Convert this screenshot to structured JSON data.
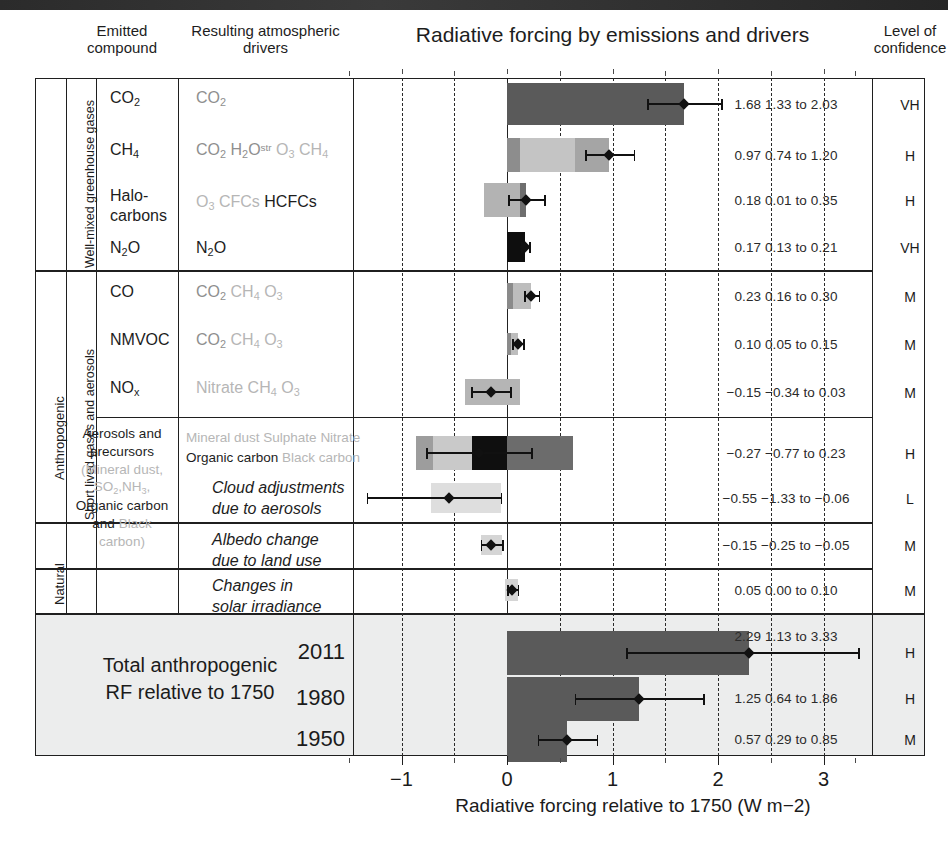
{
  "figure": {
    "title": "Radiative forcing by emissions and drivers",
    "header_emitted": "Emitted\ncompound",
    "header_emitted_l1": "Emitted",
    "header_emitted_l2": "compound",
    "header_drivers_l1": "Resulting atmospheric",
    "header_drivers_l2": "drivers",
    "header_confidence_l1": "Level of",
    "header_confidence_l2": "confidence",
    "axis_title": "Radiative forcing relative to 1750 (W m−2)",
    "total_label_l1": "Total anthropogenic",
    "total_label_l2": "RF relative to 1750"
  },
  "side_labels": {
    "anthropogenic": "Anthropogenic",
    "natural": "Natural",
    "wmgg": "Well-mixed greenhouse gases",
    "short_lived": "Short lived gases and aerosols"
  },
  "axis": {
    "ticks": [
      "−1",
      "0",
      "1",
      "2",
      "3"
    ],
    "tick_values": [
      -1,
      0,
      1,
      2,
      3
    ],
    "xmin": -1.5,
    "xmax": 3.4,
    "dashed_gridlines": [
      -1.0,
      -0.5,
      0.5,
      1.0,
      1.5,
      2.0,
      2.5,
      3.0
    ],
    "unit": "W m−2"
  },
  "rows": [
    {
      "id": "co2",
      "emitted": "CO2",
      "drivers": [
        {
          "t": "CO2",
          "shade": "dark"
        }
      ],
      "value_text": "1.68 1.33 to 2.03",
      "best": 1.68,
      "lo": 1.33,
      "hi": 2.03,
      "confidence": "VH",
      "segments": [
        {
          "from": 0,
          "to": 1.68,
          "fill": "#5a5a5a"
        }
      ]
    },
    {
      "id": "ch4",
      "emitted": "CH4",
      "drivers": [
        {
          "t": "CO2",
          "shade": "mid"
        },
        {
          "t": "H2Ostr",
          "shade": "mid"
        },
        {
          "t": "O3",
          "shade": "light"
        },
        {
          "t": "CH4",
          "shade": "light"
        }
      ],
      "value_text": "0.97 0.74 to 1.20",
      "best": 0.97,
      "lo": 0.74,
      "hi": 1.2,
      "confidence": "H",
      "segments": [
        {
          "from": 0,
          "to": 0.12,
          "fill": "#8d8d8d"
        },
        {
          "from": 0.12,
          "to": 0.64,
          "fill": "#c4c4c4"
        },
        {
          "from": 0.64,
          "to": 0.97,
          "fill": "#a5a5a5"
        }
      ]
    },
    {
      "id": "halocarbons",
      "emitted_l1": "Halo-",
      "emitted_l2": "carbons",
      "drivers": [
        {
          "t": "O3",
          "shade": "light"
        },
        {
          "t": "CFCs",
          "shade": "light"
        },
        {
          "t": "HCFCs",
          "shade": "dark"
        }
      ],
      "value_text": "0.18 0.01 to 0.35",
      "best": 0.18,
      "lo": 0.01,
      "hi": 0.35,
      "confidence": "H",
      "segments": [
        {
          "from": -0.22,
          "to": 0.12,
          "fill": "#b3b3b3"
        },
        {
          "from": 0.12,
          "to": 0.18,
          "fill": "#6e6e6e"
        }
      ]
    },
    {
      "id": "n2o",
      "emitted": "N2O",
      "drivers": [
        {
          "t": "N2O",
          "shade": "dark"
        }
      ],
      "value_text": "0.17 0.13 to 0.21",
      "best": 0.17,
      "lo": 0.13,
      "hi": 0.21,
      "confidence": "VH",
      "segments": [
        {
          "from": 0,
          "to": 0.17,
          "fill": "#0e0e0e"
        }
      ]
    },
    {
      "id": "co",
      "emitted": "CO",
      "drivers": [
        {
          "t": "CO2",
          "shade": "mid"
        },
        {
          "t": "CH4",
          "shade": "light"
        },
        {
          "t": "O3",
          "shade": "light"
        }
      ],
      "value_text": "0.23 0.16 to 0.30",
      "best": 0.23,
      "lo": 0.16,
      "hi": 0.3,
      "confidence": "M",
      "segments": [
        {
          "from": 0,
          "to": 0.06,
          "fill": "#8a8a8a"
        },
        {
          "from": 0.06,
          "to": 0.23,
          "fill": "#bdbdbd"
        }
      ]
    },
    {
      "id": "nmvoc",
      "emitted": "NMVOC",
      "drivers": [
        {
          "t": "CO2",
          "shade": "mid"
        },
        {
          "t": "CH4",
          "shade": "light"
        },
        {
          "t": "O3",
          "shade": "light"
        }
      ],
      "value_text": "0.10 0.05 to 0.15",
      "best": 0.1,
      "lo": 0.05,
      "hi": 0.15,
      "confidence": "M",
      "segments": [
        {
          "from": 0,
          "to": 0.04,
          "fill": "#8a8a8a"
        },
        {
          "from": 0.04,
          "to": 0.1,
          "fill": "#bdbdbd"
        }
      ]
    },
    {
      "id": "nox",
      "emitted": "NOx",
      "drivers": [
        {
          "t": "Nitrate",
          "shade": "light"
        },
        {
          "t": "CH4",
          "shade": "light"
        },
        {
          "t": "O3",
          "shade": "light"
        }
      ],
      "value_text": "−0.15 −0.34 to 0.03",
      "best": -0.15,
      "lo": -0.34,
      "hi": 0.03,
      "confidence": "M",
      "segments": [
        {
          "from": -0.4,
          "to": 0.12,
          "fill": "#b5b5b5"
        }
      ]
    },
    {
      "id": "aerosols",
      "emitted_l1": "Aerosols and",
      "emitted_l2": "precursors",
      "emitted_l3": "(Mineral dust,",
      "emitted_l4": "SO2,NH3,",
      "emitted_l5": "Organic carbon",
      "emitted_l6": "and Black carbon)",
      "drivers": [
        {
          "t": "Mineral dust",
          "shade": "light"
        },
        {
          "t": "Sulphate",
          "shade": "light"
        },
        {
          "t": "Nitrate",
          "shade": "light"
        },
        {
          "t": "Organic carbon",
          "shade": "dark"
        },
        {
          "t": "Black carbon",
          "shade": "light"
        }
      ],
      "value_text": "−0.27 −0.77 to 0.23",
      "best": -0.27,
      "lo": -0.77,
      "hi": 0.23,
      "confidence": "H",
      "segments": [
        {
          "from": -0.86,
          "to": -0.7,
          "fill": "#9d9d9d"
        },
        {
          "from": -0.7,
          "to": -0.33,
          "fill": "#c9c9c9"
        },
        {
          "from": -0.33,
          "to": 0.0,
          "fill": "#0f0f0f"
        },
        {
          "from": 0.0,
          "to": 0.63,
          "fill": "#6c6c6c"
        }
      ]
    },
    {
      "id": "cloud",
      "drivers_italic_l1": "Cloud adjustments",
      "drivers_italic_l2": "due to aerosols",
      "value_text": "−0.55 −1.33 to −0.06",
      "best": -0.55,
      "lo": -1.33,
      "hi": -0.06,
      "confidence": "L",
      "segments": [
        {
          "from": -0.72,
          "to": -0.06,
          "fill": "#dedede"
        }
      ]
    },
    {
      "id": "albedo",
      "drivers_italic_l1": "Albedo change",
      "drivers_italic_l2": "due to land use",
      "value_text": "−0.15 −0.25 to −0.05",
      "best": -0.15,
      "lo": -0.25,
      "hi": -0.05,
      "confidence": "M",
      "segments": [
        {
          "from": -0.25,
          "to": -0.05,
          "fill": "#d5d5d5"
        }
      ]
    },
    {
      "id": "solar",
      "drivers_italic_l1": "Changes in",
      "drivers_italic_l2": "solar irradiance",
      "value_text": "0.05 0.00 to 0.10",
      "best": 0.05,
      "lo": 0.0,
      "hi": 0.1,
      "confidence": "M",
      "segments": [
        {
          "from": -0.02,
          "to": 0.1,
          "fill": "#d5d5d5"
        }
      ]
    }
  ],
  "totals": [
    {
      "year": "2011",
      "value_text": "2.29 1.13 to 3.33",
      "best": 2.29,
      "lo": 1.13,
      "hi": 3.33,
      "confidence": "H",
      "segments": [
        {
          "from": 0,
          "to": 2.29,
          "fill": "#5a5a5a"
        }
      ]
    },
    {
      "year": "1980",
      "value_text": "1.25 0.64 to 1.86",
      "best": 1.25,
      "lo": 0.64,
      "hi": 1.86,
      "confidence": "H",
      "segments": [
        {
          "from": 0,
          "to": 1.25,
          "fill": "#5a5a5a"
        }
      ]
    },
    {
      "year": "1950",
      "value_text": "0.57 0.29  to 0.85",
      "best": 0.57,
      "lo": 0.29,
      "hi": 0.85,
      "confidence": "M",
      "segments": [
        {
          "from": 0,
          "to": 0.57,
          "fill": "#5a5a5a"
        }
      ]
    }
  ],
  "chart_data": {
    "type": "bar",
    "title": "Radiative forcing by emissions and drivers",
    "xlabel": "Radiative forcing relative to 1750 (W m−2)",
    "ylabel": "",
    "xlim": [
      -1.5,
      3.4
    ],
    "grid": "vertical dashed every 0.5",
    "orientation": "horizontal",
    "categories": [
      "CO2",
      "CH4",
      "Halocarbons",
      "N2O",
      "CO",
      "NMVOC",
      "NOx",
      "Aerosols and precursors",
      "Cloud adjustments due to aerosols",
      "Albedo change due to land use",
      "Changes in solar irradiance",
      "Total anthropogenic RF 2011",
      "Total anthropogenic RF 1980",
      "Total anthropogenic RF 1950"
    ],
    "values": [
      1.68,
      0.97,
      0.18,
      0.17,
      0.23,
      0.1,
      -0.15,
      -0.27,
      -0.55,
      -0.15,
      0.05,
      2.29,
      1.25,
      0.57
    ],
    "uncertainty_low": [
      1.33,
      0.74,
      0.01,
      0.13,
      0.16,
      0.05,
      -0.34,
      -0.77,
      -1.33,
      -0.25,
      0.0,
      1.13,
      0.64,
      0.29
    ],
    "uncertainty_high": [
      2.03,
      1.2,
      0.35,
      0.21,
      0.3,
      0.15,
      0.03,
      0.23,
      -0.06,
      -0.05,
      0.1,
      3.33,
      1.86,
      0.85
    ],
    "confidence": [
      "VH",
      "H",
      "H",
      "VH",
      "M",
      "M",
      "M",
      "H",
      "L",
      "M",
      "M",
      "H",
      "H",
      "M"
    ]
  }
}
